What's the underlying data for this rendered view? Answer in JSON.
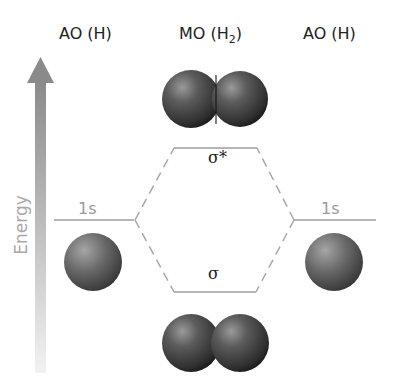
{
  "headers": {
    "left": "AO (H)",
    "middle_main": "MO (H",
    "middle_sub": "2",
    "middle_close": ")",
    "right": "AO (H)"
  },
  "axis": {
    "label": "Energy",
    "arrow_color_top": "#8c8c8c",
    "arrow_color_bottom": "#f0f0f0"
  },
  "levels": {
    "ao_left": {
      "label": "1s"
    },
    "ao_right": {
      "label": "1s"
    },
    "antibonding": {
      "label": "σ*"
    },
    "bonding": {
      "label": "σ"
    }
  },
  "colors": {
    "level_line": "#9e9e9e",
    "dashed_line": "#a8a8a8",
    "sphere_dark": "#2a2a2a",
    "sphere_light": "#8a8a8a"
  },
  "icons": {
    "atom_left": "hydrogen-atom-sphere",
    "atom_right": "hydrogen-atom-sphere",
    "molecule_antibonding": "h2-antibonding-orbital",
    "molecule_bonding": "h2-bonding-orbital"
  }
}
